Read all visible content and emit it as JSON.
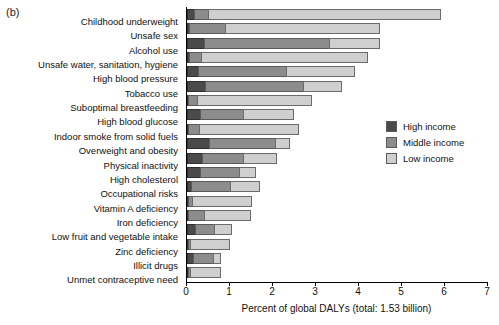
{
  "panel": {
    "label": "(b)"
  },
  "legend": {
    "position": "right-middle",
    "entries": [
      {
        "label": "High income",
        "color": "#4a4a4a",
        "key": "high"
      },
      {
        "label": "Middle income",
        "color": "#8c8c8c",
        "key": "middle"
      },
      {
        "label": "Low income",
        "color": "#cfcfcf",
        "key": "low"
      }
    ]
  },
  "axis": {
    "xlabel": "Percent of global DALYs (total: 1.53 billion)",
    "ticks": [
      "0",
      "1",
      "2",
      "3",
      "4",
      "5",
      "6",
      "7"
    ]
  },
  "chart_data": {
    "type": "bar",
    "orientation": "horizontal",
    "stacked": true,
    "title": "",
    "xlabel": "Percent of global DALYs (total: 1.53 billion)",
    "ylabel": "",
    "xlim": [
      0,
      7
    ],
    "xticks": [
      0,
      1,
      2,
      3,
      4,
      5,
      6,
      7
    ],
    "grid": false,
    "legend_position": "right",
    "categories": [
      "Childhood underweight",
      "Unsafe sex",
      "Alcohol use",
      "Unsafe water, sanitation, hygiene",
      "High blood pressure",
      "Tobacco use",
      "Suboptimal breastfeeding",
      "High blood glucose",
      "Indoor smoke from solid fuels",
      "Overweight and obesity",
      "Physical inactivity",
      "High cholesterol",
      "Occupational risks",
      "Vitamin A deficiency",
      "Iron deficiency",
      "Low fruit and vegetable intake",
      "Zinc deficiency",
      "Illicit drugs",
      "Unmet contraceptive need"
    ],
    "series": [
      {
        "name": "High income",
        "color": "#4a4a4a",
        "values": [
          0.17,
          0.05,
          0.4,
          0.05,
          0.26,
          0.42,
          0.03,
          0.3,
          0.02,
          0.5,
          0.35,
          0.3,
          0.1,
          0.02,
          0.03,
          0.18,
          0.02,
          0.15,
          0.03
        ]
      },
      {
        "name": "Middle income",
        "color": "#8c8c8c",
        "values": [
          0.33,
          0.83,
          2.9,
          0.28,
          2.04,
          2.28,
          0.2,
          1.0,
          0.25,
          1.55,
          0.95,
          0.9,
          0.9,
          0.1,
          0.37,
          0.45,
          0.05,
          0.45,
          0.05
        ]
      },
      {
        "name": "Low income",
        "color": "#cfcfcf",
        "values": [
          5.4,
          3.62,
          1.2,
          3.87,
          1.6,
          0.9,
          2.67,
          1.2,
          2.33,
          0.35,
          0.8,
          0.4,
          0.7,
          1.38,
          1.1,
          0.42,
          0.93,
          0.2,
          0.72
        ]
      }
    ],
    "totals": [
      5.9,
      4.5,
      4.5,
      4.2,
      3.9,
      3.6,
      2.9,
      2.5,
      2.6,
      2.4,
      2.1,
      1.6,
      1.7,
      1.5,
      1.5,
      1.05,
      1.0,
      0.8,
      0.8
    ]
  }
}
